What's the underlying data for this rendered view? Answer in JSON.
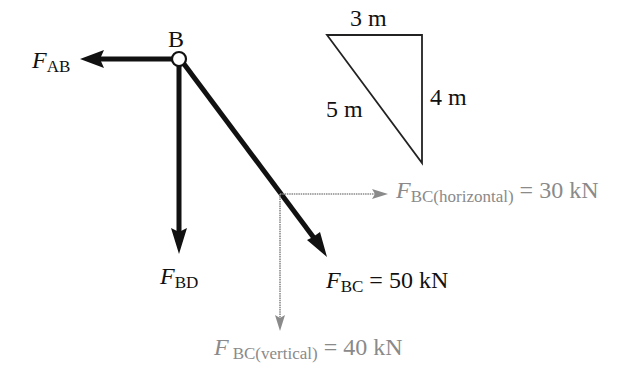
{
  "diagram": {
    "type": "free-body-diagram",
    "node": {
      "label": "B"
    },
    "forces": {
      "ab": {
        "symbol": "F",
        "subscript": "AB"
      },
      "bd": {
        "symbol": "F",
        "subscript": "BD"
      },
      "bc": {
        "symbol": "F",
        "subscript": "BC",
        "equals": "=",
        "value": "50 kN"
      },
      "bc_horizontal": {
        "symbol": "F",
        "subscript": "BC(horizontal)",
        "equals": "=",
        "value": "30 kN"
      },
      "bc_vertical": {
        "symbol": "F",
        "subscript": "BC(vertical)",
        "equals": "=",
        "value": "40 kN"
      }
    },
    "triangle": {
      "top_label": "3 m",
      "right_label": "4 m",
      "hypotenuse_label": "5 m"
    },
    "colors": {
      "main": "#111111",
      "component": "#8a8a8a",
      "background": "#ffffff"
    }
  }
}
